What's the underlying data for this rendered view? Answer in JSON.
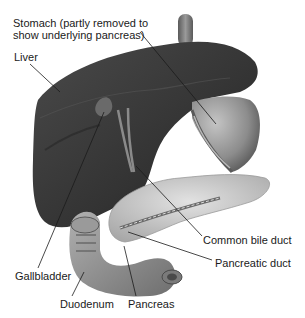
{
  "diagram": {
    "type": "anatomical-illustration",
    "labels": [
      {
        "id": "stomach",
        "text_line1": "Stomach (partly removed to",
        "text_line2": "show underlying pancreas)"
      },
      {
        "id": "liver",
        "text": "Liver"
      },
      {
        "id": "gallbladder",
        "text": "Gallbladder"
      },
      {
        "id": "duodenum",
        "text": "Duodenum"
      },
      {
        "id": "pancreas",
        "text": "Pancreas"
      },
      {
        "id": "common_bile_duct",
        "text": "Common bile duct"
      },
      {
        "id": "pancreatic_duct",
        "text": "Pancreatic duct"
      }
    ],
    "colors": {
      "background": "#ffffff",
      "liver": "#3c3c3c",
      "liver_dark": "#1e1e1e",
      "stomach": "#8a8a8a",
      "pancreas": "#c8c8c8",
      "duodenum": "#8f8f8f",
      "text": "#1a1a1a",
      "leader_line": "#1a1a1a"
    }
  }
}
